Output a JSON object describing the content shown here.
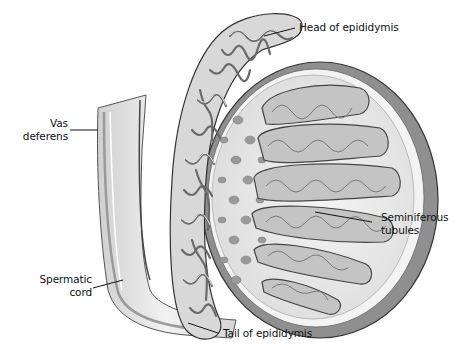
{
  "diagram": {
    "labels": [
      {
        "id": "head-of-epididymis",
        "text": "Head of epididymis"
      },
      {
        "id": "vas-deferens",
        "text": "Vas\ndeferens"
      },
      {
        "id": "seminiferous-tubules",
        "text": "Seminiferous\ntubules"
      },
      {
        "id": "spermatic-cord",
        "text": "Spermatic\ncord"
      },
      {
        "id": "tail-of-epididymis",
        "text": "Tail of epididymis"
      }
    ],
    "colors": {
      "background": "#ffffff",
      "outline": "#3a3a3a",
      "tunica": "#8c8c8c",
      "tissue": "#e6e6e6",
      "tubule_fill": "#bdbdbd",
      "leader_line": "#111111"
    }
  }
}
